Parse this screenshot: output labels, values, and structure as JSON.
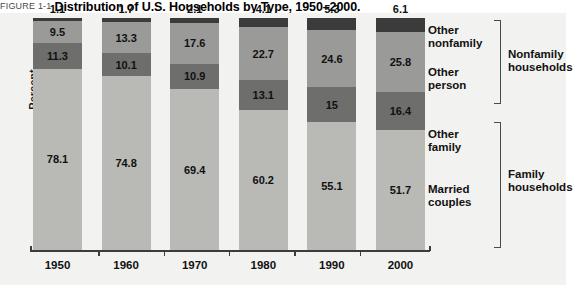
{
  "figure": {
    "tag": "FIGURE 1-1",
    "title": "Distribution of U.S. Households by Type, 1950–2000."
  },
  "axis": {
    "ylabel": "Percent"
  },
  "legend": {
    "segments": [
      {
        "line1": "Other",
        "line2": "nonfamily"
      },
      {
        "line1": "Other",
        "line2": "person"
      },
      {
        "line1": "Other",
        "line2": "family"
      },
      {
        "line1": "Married",
        "line2": "couples"
      }
    ],
    "groups": [
      {
        "line1": "Nonfamily",
        "line2": "households"
      },
      {
        "line1": "Family",
        "line2": "households"
      }
    ]
  },
  "chart_data": {
    "type": "bar",
    "title": "Distribution of U.S. Households by Type, 1950–2000.",
    "xlabel": "",
    "ylabel": "Percent",
    "ylim": [
      0,
      100
    ],
    "grid": false,
    "legend_position": "right",
    "stacked": true,
    "categories": [
      "1950",
      "1960",
      "1970",
      "1980",
      "1990",
      "2000"
    ],
    "series": [
      {
        "name": "Married couples",
        "color": "#b9b9b6",
        "values": [
          78.1,
          74.8,
          69.4,
          60.2,
          55.1,
          51.7
        ],
        "labels": [
          "78.1",
          "74.8",
          "69.4",
          "60.2",
          "55.1",
          "51.7"
        ]
      },
      {
        "name": "Other family",
        "color": "#6e6e6c",
        "values": [
          11.3,
          10.1,
          10.9,
          13.1,
          15.0,
          16.4
        ],
        "labels": [
          "11.3",
          "10.1",
          "10.9",
          "13.1",
          "15",
          "16.4"
        ]
      },
      {
        "name": "Other person",
        "color": "#9a9a98",
        "values": [
          9.5,
          13.3,
          17.6,
          22.7,
          24.6,
          25.8
        ],
        "labels": [
          "9.5",
          "13.3",
          "17.6",
          "22.7",
          "24.6",
          "25.8"
        ]
      },
      {
        "name": "Other nonfamily",
        "color": "#3b3b3b",
        "values": [
          1.1,
          1.7,
          2.1,
          4.1,
          5.3,
          6.1
        ],
        "labels": [
          "1.1",
          "1.7",
          "2.1",
          "4.1",
          "5.3",
          "6.1"
        ]
      }
    ],
    "groups": [
      {
        "name": "Nonfamily households",
        "members": [
          "Other nonfamily",
          "Other person"
        ]
      },
      {
        "name": "Family households",
        "members": [
          "Other family",
          "Married couples"
        ]
      }
    ]
  }
}
